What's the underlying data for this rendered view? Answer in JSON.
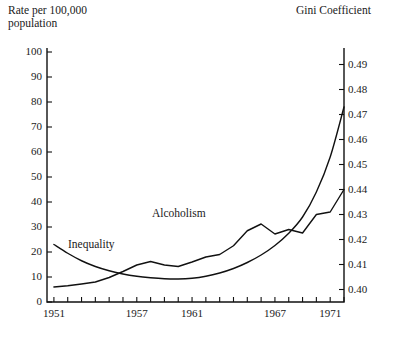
{
  "chart_data": {
    "type": "line",
    "title": "",
    "xlabel": "",
    "ylabel": "Rate per 100,000\npopulation",
    "y2label": "Gini Coefficient",
    "grid": false,
    "legend_position": "inline-annotation",
    "xlim": [
      1950.5,
      1972.0
    ],
    "ylim": [
      0,
      100
    ],
    "y2lim": [
      0.395,
      0.495
    ],
    "xticks": [
      1951,
      1952,
      1953,
      1954,
      1955,
      1956,
      1957,
      1958,
      1959,
      1960,
      1961,
      1962,
      1963,
      1964,
      1965,
      1966,
      1967,
      1968,
      1969,
      1970,
      1971,
      1972
    ],
    "xtick_labels": [
      "1951",
      "1957",
      "1961",
      "1967",
      "1971"
    ],
    "xtick_label_values": [
      1951,
      1957,
      1961,
      1967,
      1971
    ],
    "yticks": [
      0,
      10,
      20,
      30,
      40,
      50,
      60,
      70,
      80,
      90,
      100
    ],
    "ytick_labels": [
      "0",
      "10",
      "20",
      "30",
      "40",
      "50",
      "60",
      "70",
      "80",
      "90",
      "100"
    ],
    "y2ticks": [
      0.4,
      0.41,
      0.42,
      0.43,
      0.44,
      0.45,
      0.46,
      0.47,
      0.48,
      0.49
    ],
    "y2tick_labels": [
      "0.40",
      "0.41",
      "0.42",
      "0.43",
      "0.44",
      "0.45",
      "0.46",
      "0.47",
      "0.48",
      "0.49"
    ],
    "annotations": [
      {
        "text": "Inequality",
        "x": 1953.0,
        "y": 26.0
      },
      {
        "text": "Alcoholism",
        "x": 1959.5,
        "y": 34.5
      }
    ],
    "series": [
      {
        "name": "Alcoholism",
        "axis": "left",
        "units": "Rate per 100,000 population",
        "x": [
          1951,
          1952,
          1953,
          1954,
          1955,
          1956,
          1957,
          1958,
          1959,
          1960,
          1961,
          1962,
          1963,
          1964,
          1965,
          1966,
          1967,
          1968,
          1969,
          1970,
          1971,
          1972
        ],
        "values": [
          23.0,
          19.5,
          16.5,
          14.2,
          12.5,
          11.2,
          10.3,
          9.7,
          9.3,
          9.2,
          9.5,
          10.3,
          11.6,
          13.4,
          15.8,
          18.8,
          22.6,
          27.5,
          34.0,
          44.0,
          58.0,
          78.0
        ]
      },
      {
        "name": "Inequality",
        "axis": "right",
        "units": "Gini Coefficient",
        "x": [
          1951,
          1952,
          1953,
          1954,
          1955,
          1956,
          1957,
          1958,
          1959,
          1960,
          1961,
          1962,
          1963,
          1964,
          1965,
          1966,
          1967,
          1968,
          1969,
          1970,
          1971,
          1972
        ],
        "values": [
          0.401,
          0.4015,
          0.4022,
          0.403,
          0.4048,
          0.4072,
          0.4098,
          0.4112,
          0.4098,
          0.4092,
          0.411,
          0.413,
          0.414,
          0.4175,
          0.4235,
          0.4262,
          0.4222,
          0.424,
          0.4226,
          0.43,
          0.431,
          0.44
        ]
      }
    ]
  }
}
